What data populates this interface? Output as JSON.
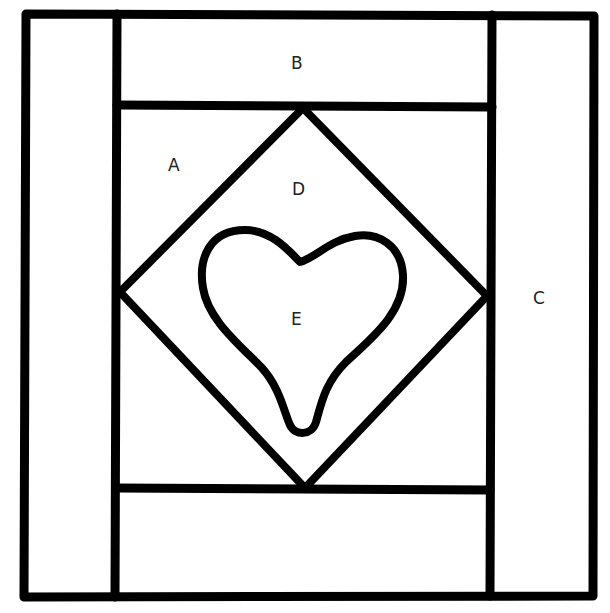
{
  "diagram": {
    "labels": {
      "A": "A",
      "B": "B",
      "C": "C",
      "D": "D",
      "E": "E"
    },
    "colors": {
      "stroke": "#000000",
      "background": "#ffffff",
      "label": "#222222"
    }
  }
}
